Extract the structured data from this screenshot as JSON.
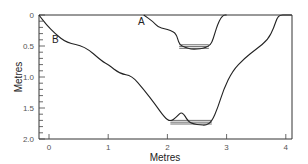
{
  "chart_data": {
    "type": "line",
    "title": "",
    "xlabel": "Metres",
    "ylabel": "Metres",
    "xlim": [
      -0.17,
      4.1
    ],
    "ylim": [
      2.0,
      0
    ],
    "x_ticks": [
      "0",
      "1",
      "2",
      "3",
      "4"
    ],
    "y_ticks": [
      "0",
      "0.5",
      "1.0",
      "1.5",
      "2.0"
    ],
    "grid": false,
    "annotations": [
      "A",
      "B"
    ],
    "series": [
      {
        "name": "A",
        "x": [
          1.6,
          1.75,
          1.85,
          1.95,
          2.05,
          2.15,
          2.2,
          2.3,
          2.4,
          2.5,
          2.6,
          2.7,
          2.75,
          2.8,
          2.85,
          2.9,
          2.95,
          3.0
        ],
        "y": [
          0.0,
          0.1,
          0.2,
          0.22,
          0.25,
          0.3,
          0.48,
          0.52,
          0.55,
          0.55,
          0.54,
          0.5,
          0.45,
          0.3,
          0.15,
          0.05,
          0.0,
          0.0
        ],
        "water_level": 0.48
      },
      {
        "name": "B",
        "x": [
          -0.17,
          -0.05,
          0.1,
          0.3,
          0.6,
          0.9,
          1.0,
          1.2,
          1.4,
          1.6,
          1.8,
          1.95,
          2.05,
          2.15,
          2.25,
          2.35,
          2.45,
          2.55,
          2.65,
          2.75,
          2.85,
          2.95,
          3.1,
          3.3,
          3.5,
          3.7,
          3.8,
          3.85,
          3.9,
          4.0,
          4.1
        ],
        "y": [
          0.0,
          0.15,
          0.3,
          0.45,
          0.5,
          0.75,
          0.8,
          0.95,
          0.98,
          1.2,
          1.45,
          1.65,
          1.72,
          1.65,
          1.55,
          1.72,
          1.76,
          1.77,
          1.78,
          1.72,
          1.5,
          1.2,
          0.9,
          0.7,
          0.55,
          0.4,
          0.2,
          0.05,
          0.0,
          0.0,
          0.0
        ],
        "water_level": 1.7
      }
    ]
  }
}
